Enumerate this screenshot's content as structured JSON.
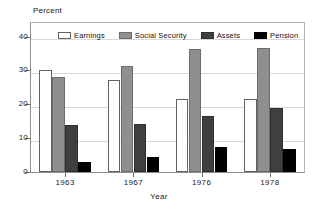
{
  "chart_data": {
    "type": "bar",
    "title": "",
    "xlabel": "Year",
    "ylabel": "Percent",
    "categories": [
      "1963",
      "1967",
      "1976",
      "1978"
    ],
    "series": [
      {
        "name": "Earnings",
        "color": "#ffffff",
        "values": [
          30.0,
          27.2,
          21.5,
          21.6
        ]
      },
      {
        "name": "Social Security",
        "color": "#8f8f8f",
        "values": [
          28.0,
          31.2,
          36.4,
          36.5
        ]
      },
      {
        "name": "Assets",
        "color": "#3f3f3f",
        "values": [
          14.0,
          14.2,
          16.5,
          18.8
        ]
      },
      {
        "name": "Pension",
        "color": "#000000",
        "values": [
          3.1,
          4.3,
          7.5,
          6.7
        ]
      }
    ],
    "ylim": [
      0,
      44
    ],
    "yticks": [
      0,
      10,
      20,
      30,
      40
    ],
    "ytick_labels": [
      "0",
      "10",
      "20",
      "30",
      "40"
    ],
    "grid": true,
    "legend_position": "top-inside"
  },
  "axes": {
    "y_title": "Percent",
    "x_title": "Year"
  }
}
